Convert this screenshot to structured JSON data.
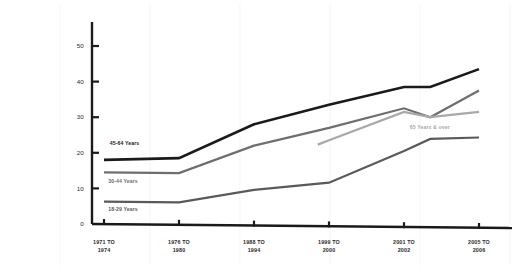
{
  "chart_data": {
    "type": "line",
    "title": "",
    "subtitle": "",
    "xlabel": "",
    "ylabel": "",
    "xlim": [
      0,
      5
    ],
    "ylim": [
      0,
      55
    ],
    "yticks": [
      0,
      10,
      20,
      30,
      40,
      50
    ],
    "ytick_labels": [
      "0",
      "10",
      "20",
      "30",
      "40",
      "50"
    ],
    "grid": false,
    "legend": "inline-labels",
    "categories": [
      "1971 TO 1974",
      "1976 TO 1980",
      "1988 TO 1994",
      "1999 TO 2000",
      "2001 TO 2002",
      "2005 TO 2006"
    ],
    "xtick_labels_line1": [
      "1971 TO",
      "1976 TO",
      "1988 TO",
      "1999 TO",
      "2001 TO",
      "2005 TO"
    ],
    "xtick_labels_line2": [
      "1974",
      "1980",
      "1994",
      "2000",
      "2002",
      "2006"
    ],
    "series": [
      {
        "name": "45-64 Years",
        "color": "#1a1a1a",
        "label_x": 0.05,
        "label_y": 22.2,
        "values": [
          18.0,
          18.5,
          28.0,
          33.5,
          38.5,
          43.5
        ],
        "extra_points": [
          [
            4.35,
            38.5
          ]
        ]
      },
      {
        "name": "30-44 Years",
        "color": "#6e6e6e",
        "label_x": 0.03,
        "label_y": 11.6,
        "values": [
          14.5,
          14.3,
          22.0,
          27.0,
          32.5,
          37.5
        ],
        "extra_points": [
          [
            4.35,
            30.0
          ]
        ]
      },
      {
        "name": "18-29 Years",
        "color": "#5a5a5a",
        "label_x": 0.03,
        "label_y": 3.6,
        "values": [
          6.3,
          6.1,
          9.6,
          11.6,
          20.5,
          24.3
        ],
        "extra_points": [
          [
            4.35,
            23.9
          ]
        ]
      },
      {
        "name": "65 Years & over",
        "color": "#a8a8a8",
        "label_x": 4.05,
        "label_y": 26.8,
        "partial_start_index": 2.85,
        "values": [
          null,
          null,
          null,
          23.5,
          31.5,
          31.5
        ],
        "extra_points": [
          [
            4.35,
            30.0
          ]
        ]
      }
    ]
  },
  "colors": {
    "background": "#ffffff",
    "axis": "#1a1a1a",
    "series_45_64": "#1a1a1a",
    "series_30_44": "#6e6e6e",
    "series_18_29": "#5a5a5a",
    "series_65_over": "#a8a8a8"
  }
}
